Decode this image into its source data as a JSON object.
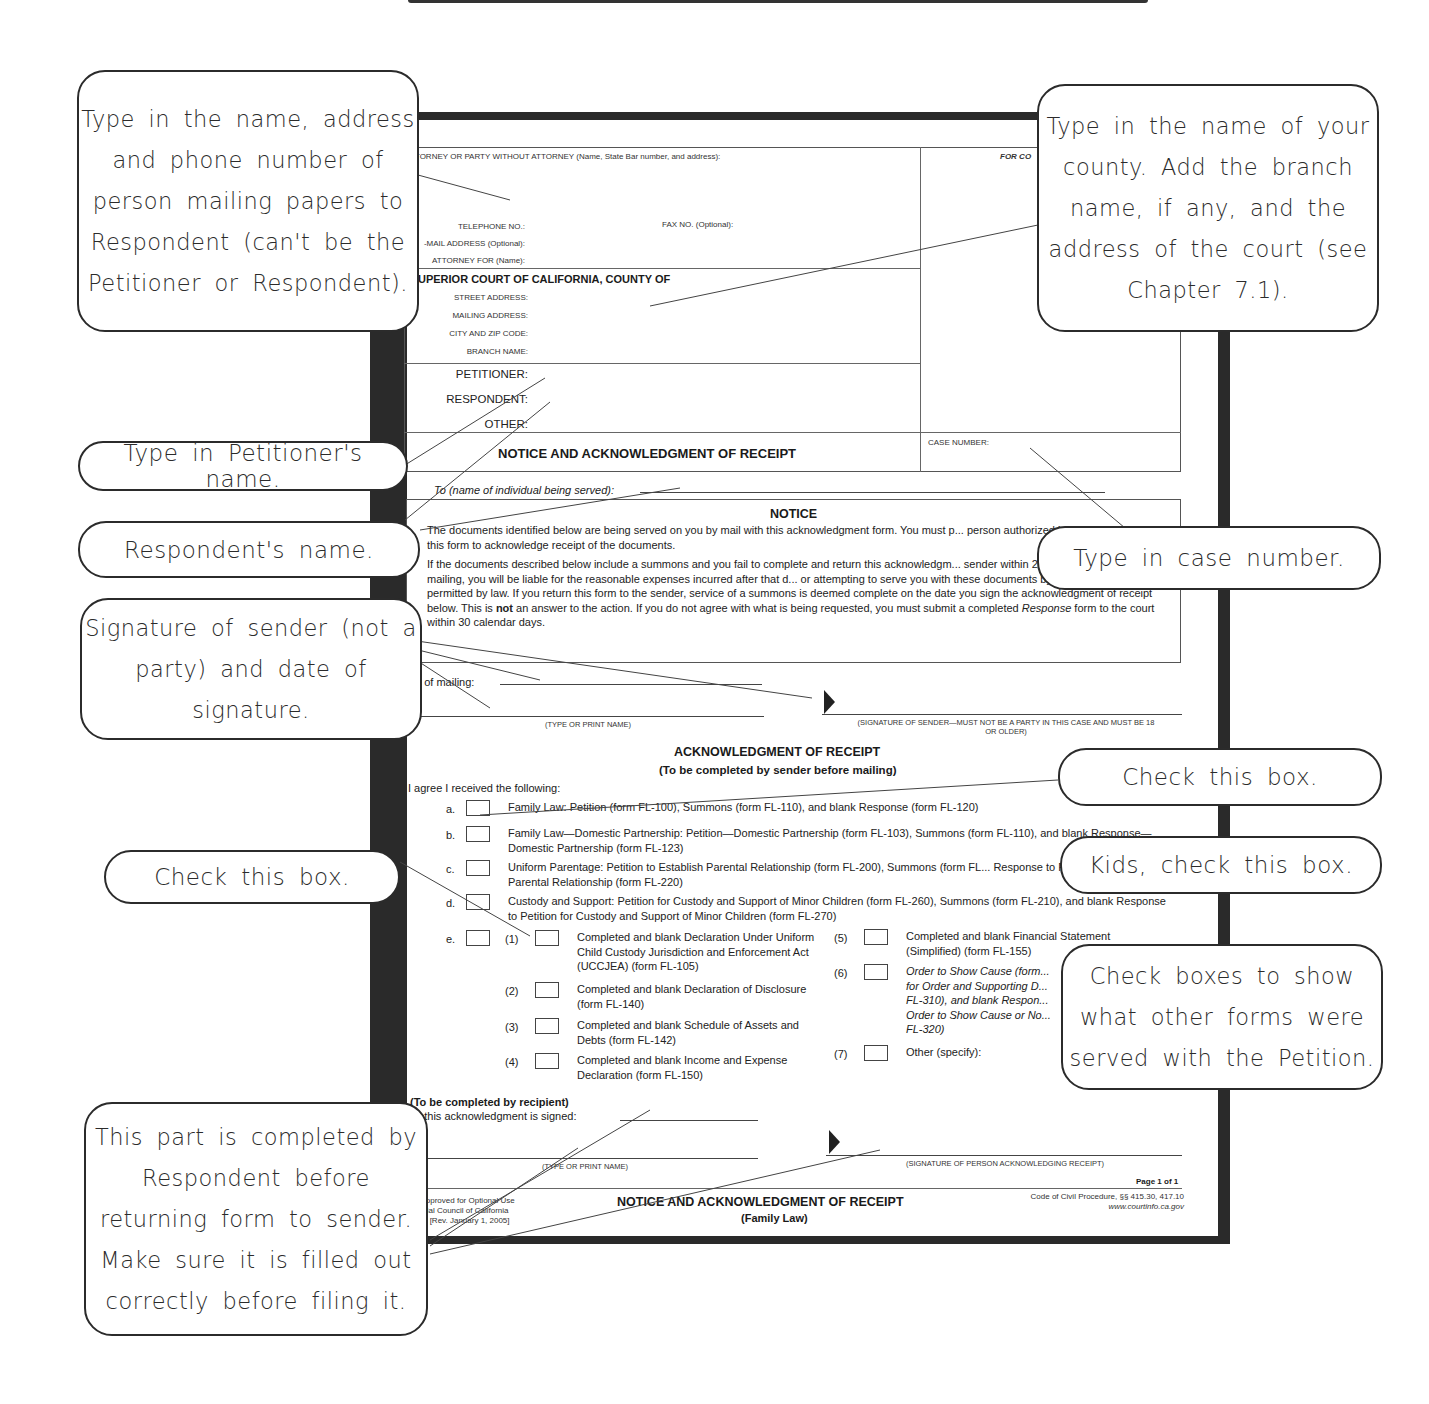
{
  "form": {
    "attorney_header": "TTORNEY OR PARTY WITHOUT ATTORNEY (Name, State Bar number, and address):",
    "for_court_use": "FOR CO",
    "telephone_label": "TELEPHONE NO.:",
    "fax_label": "FAX NO. (Optional):",
    "email_label": "-MAIL ADDRESS (Optional):",
    "attorney_for_label": "ATTORNEY FOR (Name):",
    "court_header": "UPERIOR COURT OF CALIFORNIA, COUNTY OF",
    "street_address_label": "STREET ADDRESS:",
    "mailing_address_label": "MAILING ADDRESS:",
    "city_zip_label": "CITY AND ZIP CODE:",
    "branch_name_label": "BRANCH NAME:",
    "petitioner_label": "PETITIONER:",
    "respondent_label": "RESPONDENT:",
    "other_label": "OTHER:",
    "title": "NOTICE AND ACKNOWLEDGMENT OF RECEIPT",
    "case_number_label": "CASE NUMBER:",
    "to_label": "To (name of individual being served):",
    "notice": {
      "heading": "NOTICE",
      "para1": "The documents identified below are being served on you by mail with this acknowledgment form.  You must p... person authorized by you must sign, this form to acknowledge receipt of the documents.",
      "para2_a": "If the documents described below include a summons and you fail to complete and return this acknowledgm... sender within 20 days of the date of mailing, you will be liable for the reasonable expenses incurred after that d... or attempting to serve you with these documents by any other methods permitted by law.  If you return this form to the sender, service of a summons is deemed complete on the date you sign the acknowledgment of receipt below. This is ",
      "para2_bold": "not",
      "para2_b": " an answer to the action.  If you do not agree with what is being requested, you must submit a completed ",
      "para2_italic": "Response",
      "para2_c": " form to the court within 30 calendar days."
    },
    "date_of_mailing_label": "te of mailing:",
    "type_print_name": "(TYPE OR PRINT NAME)",
    "signature_sender_caption": "(SIGNATURE OF SENDER—MUST NOT BE A PARTY IN THIS CASE AND MUST BE 18 OR OLDER)",
    "ack_heading": "ACKNOWLEDGMENT OF RECEIPT",
    "ack_subheading": "(To be completed by sender before mailing)",
    "agree_label": "I agree I received the following:",
    "items": [
      {
        "letter": "a.",
        "text": "Family Law: Petition (form FL-100), Summons (form FL-110), and blank Response (form FL-120)"
      },
      {
        "letter": "b.",
        "text": "Family Law—Domestic Partnership: Petition—Domestic Partnership (form FL-103), Summons (form FL-110), and blank Response—Domestic Partnership (form FL-123)"
      },
      {
        "letter": "c.",
        "text": "Uniform Parentage: Petition to Establish Parental Relationship (form FL-200), Summons (form FL... Response to Petition to Establish Parental Relationship (form FL-220)"
      },
      {
        "letter": "d.",
        "text": "Custody and Support: Petition for Custody and Support of Minor Children (form FL-260), Summons (form FL-210), and blank Response to Petition for Custody and Support of Minor Children (form FL-270)"
      },
      {
        "letter": "e.",
        "text": ""
      }
    ],
    "sub_items": [
      {
        "num": "(1)",
        "text": "Completed and blank Declaration Under Uniform Child Custody Jurisdiction and Enforcement Act (UCCJEA) (form FL-105)"
      },
      {
        "num": "(2)",
        "text": "Completed and blank Declaration of Disclosure (form FL-140)"
      },
      {
        "num": "(3)",
        "text": "Completed and blank Schedule of Assets and Debts (form FL-142)"
      },
      {
        "num": "(4)",
        "text": "Completed and blank Income and Expense Declaration (form FL-150)"
      },
      {
        "num": "(5)",
        "text": "Completed and blank Financial Statement (Simplified) (form FL-155)"
      },
      {
        "num": "(6)",
        "text": "Order to Show Cause (form... for Order and Supporting D... FL-310), and blank Respon... Order to Show Cause or No... FL-320)"
      },
      {
        "num": "(7)",
        "text": "Other (specify):"
      }
    ],
    "recipient_heading": "(To be completed by recipient)",
    "date_signed_label": "te this acknowledgment is signed:",
    "signature_recipient_caption": "(SIGNATURE OF PERSON ACKNOWLEDGING RECEIPT)",
    "page_label": "Page 1 of 1",
    "footer_left_1": "m Approved for Optional Use",
    "footer_left_2": "udicial Council of California",
    "footer_left_3": "-117 [Rev. January 1, 2005]",
    "footer_title": "NOTICE AND ACKNOWLEDGMENT OF RECEIPT",
    "footer_subtitle": "(Family Law)",
    "footer_right_1": "Code of Civil Procedure, §§ 415.30, 417.10",
    "footer_right_2": "www.courtinfo.ca.gov"
  },
  "callouts": {
    "sender_info": "Type in the name, address and phone number of person mailing papers to Respondent (can't be the Petitioner or Respondent).",
    "county": "Type in the name of your county. Add the branch name, if any, and the address of the court (see Chapter 7.1).",
    "petitioner_name": "Type in Petitioner's name.",
    "respondent_name": "Respondent's name.",
    "case_number": "Type in case number.",
    "signature_sender": "Signature of sender (not a party) and date of signature.",
    "check_box_a": "Check this box.",
    "check_box_e": "Check this box.",
    "kids_check_box": "Kids, check this box.",
    "other_forms": "Check boxes to show what other forms were served with the Petition.",
    "recipient_part": "This part is completed by Respondent before returning form to sender. Make sure it is filled out correctly before filing it."
  }
}
